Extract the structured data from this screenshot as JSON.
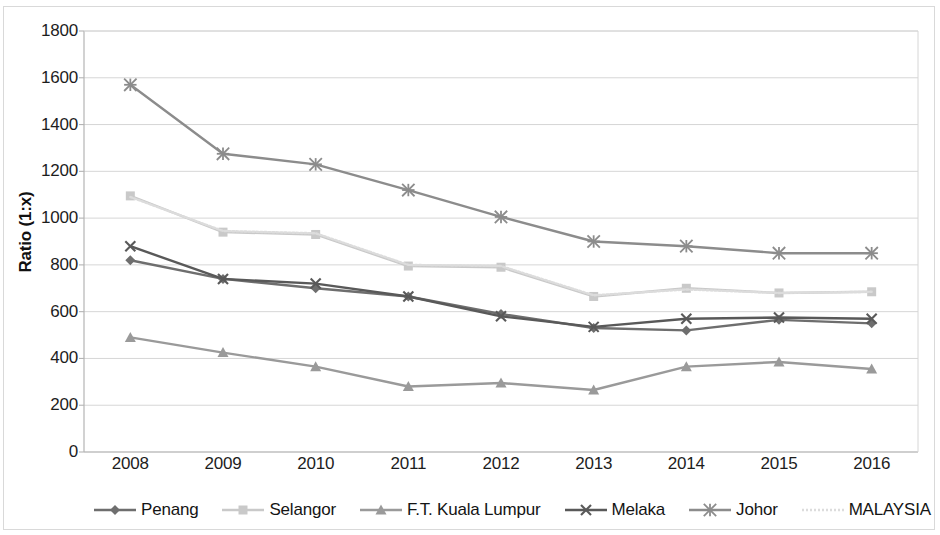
{
  "chart_data": {
    "type": "line",
    "title": "",
    "subtitle": "",
    "xlabel": "",
    "ylabel": "Ratio (1:x)",
    "categories": [
      "2008",
      "2009",
      "2010",
      "2011",
      "2012",
      "2013",
      "2014",
      "2015",
      "2016"
    ],
    "x": [
      2008,
      2009,
      2010,
      2011,
      2012,
      2013,
      2014,
      2015,
      2016
    ],
    "ylim": [
      0,
      1800
    ],
    "ytick_step": 200,
    "yticks": [
      "1800",
      "1600",
      "1400",
      "1200",
      "1000",
      "800",
      "600",
      "400",
      "200",
      "0"
    ],
    "ytick_values": [
      1800,
      1600,
      1400,
      1200,
      1000,
      800,
      600,
      400,
      200,
      0
    ],
    "grid": true,
    "grid_axis": "y",
    "legend_position": "bottom",
    "series": [
      {
        "name": "Penang",
        "marker": "diamond",
        "color": "#6e6e6e",
        "values": [
          820,
          740,
          700,
          665,
          590,
          530,
          520,
          565,
          550
        ]
      },
      {
        "name": "Selangor",
        "marker": "square",
        "color": "#c9c9c9",
        "values": [
          1095,
          940,
          930,
          795,
          790,
          665,
          700,
          680,
          685
        ]
      },
      {
        "name": "F.T. Kuala Lumpur",
        "marker": "triangle",
        "color": "#9a9a9a",
        "values": [
          490,
          425,
          365,
          280,
          295,
          265,
          365,
          385,
          355
        ]
      },
      {
        "name": "Melaka",
        "marker": "cross",
        "color": "#595959",
        "values": [
          880,
          740,
          720,
          665,
          580,
          535,
          570,
          575,
          570
        ]
      },
      {
        "name": "Johor",
        "marker": "asterisk",
        "color": "#8c8c8c",
        "values": [
          1570,
          1275,
          1230,
          1120,
          1005,
          900,
          880,
          850,
          850
        ]
      },
      {
        "name": "MALAYSIA",
        "marker": "none",
        "color": "#dcdcdc",
        "values": [
          1090,
          945,
          935,
          800,
          795,
          670,
          695,
          680,
          685
        ]
      }
    ]
  },
  "legend": {
    "items": [
      {
        "label": "Penang",
        "key": "line-diamond-marker"
      },
      {
        "label": "Selangor",
        "key": "line-square-marker"
      },
      {
        "label": "F.T. Kuala Lumpur",
        "key": "line-triangle-marker"
      },
      {
        "label": "Melaka",
        "key": "line-cross-marker"
      },
      {
        "label": "Johor",
        "key": "line-asterisk-marker"
      },
      {
        "label": "MALAYSIA",
        "key": "line-plain-marker"
      }
    ]
  },
  "axis": {
    "y_title": "Ratio (1:x)"
  },
  "colors": {
    "grid": "#d6d6d6",
    "axis": "#b4b4b4",
    "text": "#1d1d1d",
    "background": "#ffffff"
  }
}
